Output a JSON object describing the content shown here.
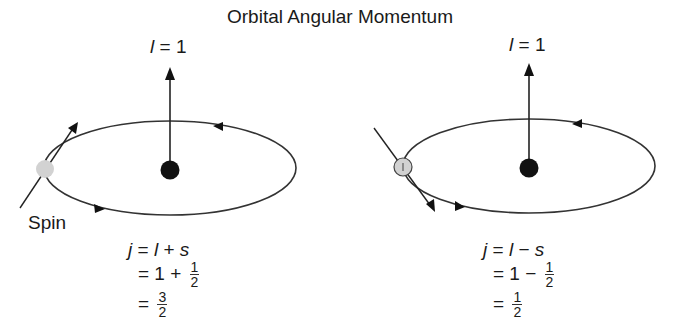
{
  "title": "Orbital Angular Momentum",
  "left": {
    "l_label_var": "l",
    "l_label_rest": " = 1",
    "spin_label": "Spin",
    "eq1": {
      "j": "j",
      "eq": " = ",
      "l": "l",
      "op": " + ",
      "s": "s"
    },
    "eq2": {
      "prefix": "= 1 + ",
      "num": "1",
      "den": "2"
    },
    "eq3": {
      "prefix": "= ",
      "num": "3",
      "den": "2"
    }
  },
  "right": {
    "l_label_var": "l",
    "l_label_rest": " = 1",
    "eq1": {
      "j": "j",
      "eq": " = ",
      "l": "l",
      "op": " − ",
      "s": "s"
    },
    "eq2": {
      "prefix": "= 1 − ",
      "num": "1",
      "den": "2"
    },
    "eq3": {
      "prefix": "= ",
      "num": "1",
      "den": "2"
    }
  },
  "colors": {
    "line": "#333333",
    "nucleus": "#111111",
    "electron": "#d0d0d0"
  }
}
